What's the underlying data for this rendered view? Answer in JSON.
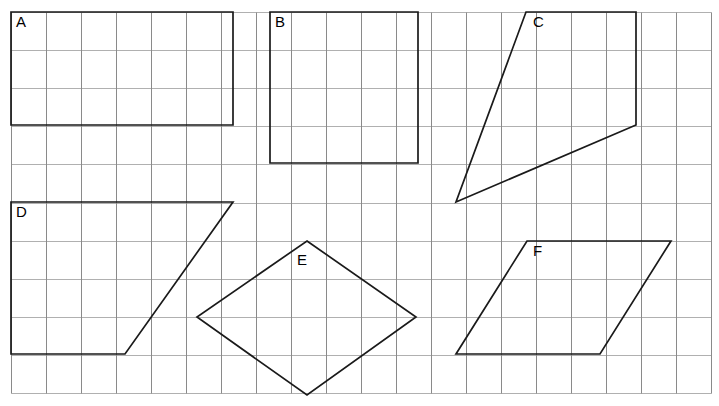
{
  "worksheet": {
    "width": 719,
    "height": 406,
    "background_color": "#ffffff",
    "description": "Grid paper worksheet showing six labelled quadrilaterals"
  },
  "grid": {
    "origin_x": 11,
    "origin_y": 12,
    "cell_width": 35,
    "cell_height": 38.1,
    "columns": 20,
    "rows": 10,
    "vertical_line_color": "#8a8a8a",
    "horizontal_line_color": "#b0b0b0",
    "line_width": 1
  },
  "shapes": [
    {
      "label": "A",
      "type": "rectangle",
      "stroke_color": "#1a1a1a",
      "points": "11,12 233,12 233,125 11,125",
      "label_x": 16,
      "label_y": 16,
      "width_cells": 6,
      "height_cells": 3
    },
    {
      "label": "B",
      "type": "square",
      "stroke_color": "#1a1a1a",
      "points": "270,12 418,12 418,163 270,163",
      "label_x": 275,
      "label_y": 16,
      "width_cells": 4,
      "height_cells": 4
    },
    {
      "label": "C",
      "type": "quadrilateral",
      "stroke_color": "#1a1a1a",
      "points": "526,12 636,12 636,125 456,202",
      "label_x": 533,
      "label_y": 16,
      "width_cells": 5,
      "height_cells": 5
    },
    {
      "label": "D",
      "type": "trapezium",
      "stroke_color": "#1a1a1a",
      "points": "11,202 233,202 125,354 11,354",
      "label_x": 16,
      "label_y": 206,
      "width_cells": 6,
      "height_cells": 4
    },
    {
      "label": "E",
      "type": "rhombus",
      "stroke_color": "#1a1a1a",
      "points": "307,241 416,317 307,395 197,317",
      "label_x": 297,
      "label_y": 254,
      "width_cells": 6,
      "height_cells": 4
    },
    {
      "label": "F",
      "type": "parallelogram",
      "stroke_color": "#1a1a1a",
      "points": "527,241 671,241 600,354 456,354",
      "label_x": 533,
      "label_y": 245,
      "width_cells": 6,
      "height_cells": 3
    }
  ]
}
